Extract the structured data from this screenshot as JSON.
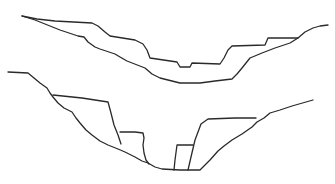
{
  "figure": {
    "stroke_color": "#2a2a2a",
    "background": "#ffffff"
  },
  "upper_section": {
    "name": "upper-valley-profile",
    "paths": [
      "M22,16 L37,19 L55,21 L92,23 L98,26 L105,32 L110,36 L135,40 L143,44 L147,50 L150,58 L177,62 L180,67 L190,67 L192,63 L220,64 L224,58 L228,50 L232,46 L265,45 L268,38 L298,38 L305,32 L313,28 L320,26 L328,25",
      "M22,16 L35,20 L60,30 L78,36 L84,37 L88,42 L95,47 L100,49 L115,54 L120,57 L127,61 L145,68 L152,74 L160,78 L180,83 L200,83 L215,81 L232,79 L237,74 L242,68 L250,58 L262,53 L275,48 L290,43 L298,38"
    ]
  },
  "lower_section": {
    "name": "lower-valley-profile",
    "paths": [
      "M8,72 L28,73 L34,78 L40,83 L47,88 L50,93 L53,97 L58,103 L64,108 L72,112 L76,118 L80,123 L86,130 L92,135 L100,141 L108,145 L118,149 L125,152 L135,157 L142,161 L148,163 L155,167 L162,169 L180,170 L200,170 L204,166 L210,160 L218,151 L224,146 L232,140 L242,134 L252,127 L257,122 L264,118 L270,113 L280,110 L292,106 L313,100",
      "M53,95 L82,98 L108,102 L111,113 L114,125 L118,135 L121,144",
      "M120,132 L135,132 L143,133 L144,138 L143,145 L144,153 L146,160 L149,164",
      "M174,170 L175,160 L177,145 L193,145",
      "M188,170 L191,157 L195,140 L201,124 L208,119 L235,118 L256,118"
    ]
  }
}
